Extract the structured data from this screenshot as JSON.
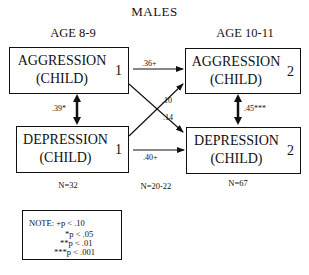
{
  "title": "MALES",
  "time_labels": {
    "left": "AGE 8-9",
    "right": "AGE 10-11"
  },
  "boxes": {
    "aggression_1": {
      "line1": "AGGRESSION",
      "line2": "(CHILD)",
      "subscript": "1"
    },
    "depression_1": {
      "line1": "DEPRESSION",
      "line2": "(CHILD)",
      "subscript": "1"
    },
    "aggression_2": {
      "line1": "AGGRESSION",
      "line2": "(CHILD)",
      "subscript": "2"
    },
    "depression_2": {
      "line1": "DEPRESSION",
      "line2": "(CHILD)",
      "subscript": "2"
    }
  },
  "paths": {
    "aggression_stability": ".36+",
    "depression_stability": ".40+",
    "depression1_to_aggression2": ".10",
    "aggression1_to_depression2": ".14",
    "time1_correlation": ".39*",
    "time2_correlation": ".45***"
  },
  "sample_sizes": {
    "time1": "N=32",
    "cross": "N=20-22",
    "time2": "N=67"
  },
  "note": {
    "rows": [
      "NOTE: +p < .10",
      "*p < .05",
      "**p < .01",
      "***p < .001"
    ]
  },
  "colors": {
    "ink": "#111111",
    "background": "#ffffff"
  }
}
